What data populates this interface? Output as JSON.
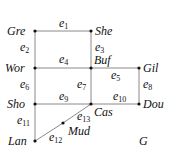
{
  "graph": {
    "name": "G",
    "nodes": [
      {
        "id": "Gre",
        "label": "Gre",
        "x": 35,
        "y": 31
      },
      {
        "id": "She",
        "label": "She",
        "x": 91,
        "y": 31
      },
      {
        "id": "Wor",
        "label": "Wor",
        "x": 35,
        "y": 68
      },
      {
        "id": "Buf",
        "label": "Buf",
        "x": 91,
        "y": 68
      },
      {
        "id": "Gil",
        "label": "Gil",
        "x": 139,
        "y": 68
      },
      {
        "id": "Sho",
        "label": "Sho",
        "x": 35,
        "y": 104
      },
      {
        "id": "Cas",
        "label": "Cas",
        "x": 91,
        "y": 104
      },
      {
        "id": "Dou",
        "label": "Dou",
        "x": 139,
        "y": 104
      },
      {
        "id": "Mud",
        "label": "Mud",
        "x": 63,
        "y": 123
      },
      {
        "id": "Lan",
        "label": "Lan",
        "x": 35,
        "y": 141
      }
    ],
    "edges": [
      {
        "id": "e1",
        "base": "e",
        "sub": "1",
        "from": "Gre",
        "to": "She"
      },
      {
        "id": "e2",
        "base": "e",
        "sub": "2",
        "from": "Gre",
        "to": "Wor"
      },
      {
        "id": "e3",
        "base": "e",
        "sub": "3",
        "from": "She",
        "to": "Buf"
      },
      {
        "id": "e4",
        "base": "e",
        "sub": "4",
        "from": "Wor",
        "to": "Buf"
      },
      {
        "id": "e5",
        "base": "e",
        "sub": "5",
        "from": "Buf",
        "to": "Gil"
      },
      {
        "id": "e6",
        "base": "e",
        "sub": "6",
        "from": "Wor",
        "to": "Sho"
      },
      {
        "id": "e7",
        "base": "e",
        "sub": "7",
        "from": "Buf",
        "to": "Cas"
      },
      {
        "id": "e8",
        "base": "e",
        "sub": "8",
        "from": "Gil",
        "to": "Dou"
      },
      {
        "id": "e9",
        "base": "e",
        "sub": "9",
        "from": "Sho",
        "to": "Cas"
      },
      {
        "id": "e10",
        "base": "e",
        "sub": "10",
        "from": "Cas",
        "to": "Dou"
      },
      {
        "id": "e11",
        "base": "e",
        "sub": "11",
        "from": "Sho",
        "to": "Lan"
      },
      {
        "id": "e12",
        "base": "e",
        "sub": "12",
        "from": "Lan",
        "to": "Mud"
      },
      {
        "id": "e13",
        "base": "e",
        "sub": "13",
        "from": "Mud",
        "to": "Cas"
      }
    ]
  }
}
